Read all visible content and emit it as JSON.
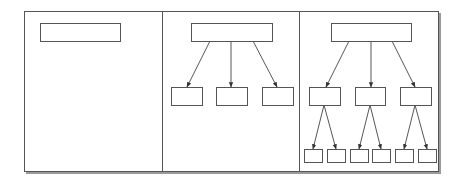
{
  "diagram": {
    "type": "tree-growth-sequence",
    "colors": {
      "line": "#555555",
      "background": "#ffffff",
      "shadow": "#9a9a9a"
    },
    "frame": {
      "x": 24,
      "y": 11,
      "width": 414,
      "height": 160
    },
    "dividers": [
      162,
      299
    ],
    "panels": [
      {
        "name": "panel-1",
        "levels": 1,
        "nodes": [
          {
            "id": "root",
            "x": 40,
            "y": 23,
            "w": 80,
            "h": 18
          }
        ],
        "edges": []
      },
      {
        "name": "panel-2",
        "levels": 2,
        "nodes": [
          {
            "id": "root",
            "x": 191,
            "y": 23,
            "w": 81,
            "h": 18
          },
          {
            "id": "c1",
            "x": 171,
            "y": 87,
            "w": 31,
            "h": 18
          },
          {
            "id": "c2",
            "x": 216,
            "y": 87,
            "w": 31,
            "h": 18
          },
          {
            "id": "c3",
            "x": 262,
            "y": 87,
            "w": 31,
            "h": 18
          }
        ],
        "edges": [
          {
            "from": [
              210,
              41
            ],
            "to": [
              187,
              87
            ]
          },
          {
            "from": [
              231,
              41
            ],
            "to": [
              231,
              87
            ]
          },
          {
            "from": [
              253,
              41
            ],
            "to": [
              277,
              87
            ]
          }
        ]
      },
      {
        "name": "panel-3",
        "levels": 3,
        "nodes": [
          {
            "id": "root",
            "x": 331,
            "y": 23,
            "w": 80,
            "h": 18
          },
          {
            "id": "c1",
            "x": 309,
            "y": 87,
            "w": 31,
            "h": 18
          },
          {
            "id": "c2",
            "x": 355,
            "y": 87,
            "w": 30,
            "h": 18
          },
          {
            "id": "c3",
            "x": 400,
            "y": 87,
            "w": 31,
            "h": 18
          },
          {
            "id": "g1",
            "x": 304,
            "y": 149,
            "w": 18,
            "h": 13
          },
          {
            "id": "g2",
            "x": 327,
            "y": 149,
            "w": 18,
            "h": 13
          },
          {
            "id": "g3",
            "x": 350,
            "y": 149,
            "w": 18,
            "h": 13
          },
          {
            "id": "g4",
            "x": 372,
            "y": 149,
            "w": 18,
            "h": 13
          },
          {
            "id": "g5",
            "x": 395,
            "y": 149,
            "w": 18,
            "h": 13
          },
          {
            "id": "g6",
            "x": 418,
            "y": 149,
            "w": 18,
            "h": 13
          }
        ],
        "edges": [
          {
            "from": [
              349,
              41
            ],
            "to": [
              326,
              87
            ]
          },
          {
            "from": [
              371,
              41
            ],
            "to": [
              371,
              87
            ]
          },
          {
            "from": [
              392,
              41
            ],
            "to": [
              415,
              87
            ]
          },
          {
            "from": [
              324,
              105
            ],
            "to": [
              313,
              149
            ]
          },
          {
            "from": [
              324,
              105
            ],
            "to": [
              336,
              149
            ]
          },
          {
            "from": [
              370,
              105
            ],
            "to": [
              359,
              149
            ]
          },
          {
            "from": [
              370,
              105
            ],
            "to": [
              381,
              149
            ]
          },
          {
            "from": [
              415,
              105
            ],
            "to": [
              404,
              149
            ]
          },
          {
            "from": [
              415,
              105
            ],
            "to": [
              427,
              149
            ]
          }
        ]
      }
    ]
  }
}
